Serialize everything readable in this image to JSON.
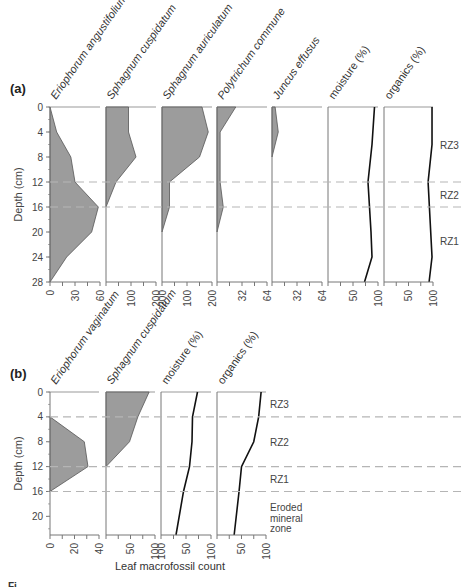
{
  "chart_data": [
    {
      "type": "area",
      "panel_label": "(a)",
      "ylabel": "Depth (cm)",
      "ylim": [
        0,
        28
      ],
      "yticks": [
        0,
        4,
        8,
        12,
        16,
        20,
        24,
        28
      ],
      "zone_boundaries": [
        12,
        16
      ],
      "zones": [
        {
          "label": "RZ3",
          "depth": 6
        },
        {
          "label": "RZ2",
          "depth": 14
        },
        {
          "label": "RZ1",
          "depth": 21.5
        }
      ],
      "series": [
        {
          "name": "Eriophorum angustifolium",
          "kind": "fill",
          "xlim": [
            0,
            60
          ],
          "xticks": [
            "0",
            "30",
            "60"
          ],
          "depth": [
            0,
            4,
            8,
            12,
            16,
            20,
            24,
            28
          ],
          "values": [
            0,
            8,
            25,
            30,
            58,
            50,
            20,
            0
          ]
        },
        {
          "name": "Sphagnum cuspidatum",
          "kind": "fill",
          "xlim": [
            0,
            200
          ],
          "xticks": [
            "100",
            "200"
          ],
          "depth": [
            0,
            4,
            8,
            12,
            16
          ],
          "values": [
            90,
            90,
            120,
            40,
            0
          ]
        },
        {
          "name": "Sphagnum auriculatum",
          "kind": "fill",
          "xlim": [
            0,
            200
          ],
          "xticks": [
            "200",
            "100",
            "200"
          ],
          "depth": [
            0,
            4,
            8,
            12,
            16,
            20
          ],
          "values": [
            160,
            185,
            150,
            30,
            30,
            0
          ]
        },
        {
          "name": "Polytrichum commune",
          "kind": "fill",
          "xlim": [
            0,
            64
          ],
          "xticks": [
            "32",
            "64"
          ],
          "depth": [
            0,
            4,
            12,
            16,
            20
          ],
          "values": [
            24,
            4,
            4,
            8,
            0
          ]
        },
        {
          "name": "Juncus effusus",
          "kind": "fill",
          "xlim": [
            0,
            64
          ],
          "xticks": [
            "32",
            "64"
          ],
          "depth": [
            0,
            4,
            8
          ],
          "values": [
            4,
            8,
            0
          ]
        },
        {
          "name": "moisture (%)",
          "kind": "line",
          "xlim": [
            0,
            100
          ],
          "xticks": [
            "50",
            "100"
          ],
          "depth": [
            0,
            6,
            12,
            20,
            24,
            28
          ],
          "values": [
            93,
            88,
            80,
            86,
            88,
            73
          ]
        },
        {
          "name": "organics (%)",
          "kind": "line",
          "xlim": [
            0,
            100
          ],
          "xticks": [
            "50",
            "100"
          ],
          "depth": [
            0,
            6,
            12,
            18,
            24,
            28
          ],
          "values": [
            98,
            98,
            90,
            94,
            98,
            92
          ]
        }
      ]
    },
    {
      "type": "area",
      "panel_label": "(b)",
      "ylabel": "Depth (cm)",
      "ylim": [
        0,
        23
      ],
      "yticks": [
        0,
        4,
        8,
        12,
        16,
        20
      ],
      "zone_boundaries": [
        4,
        12,
        16
      ],
      "zones": [
        {
          "label": "RZ3",
          "depth": 2
        },
        {
          "label": "RZ2",
          "depth": 8
        },
        {
          "label": "RZ1",
          "depth": 14
        },
        {
          "label": "Eroded",
          "depth": 18.5
        },
        {
          "label": "mineral",
          "depth": 20.2
        },
        {
          "label": "zone",
          "depth": 21.9
        }
      ],
      "series": [
        {
          "name": "Eriophorum vaginatum",
          "kind": "fill",
          "xlim": [
            0,
            40
          ],
          "xticks": [
            "0",
            "20",
            "40"
          ],
          "depth": [
            4,
            8,
            12,
            16
          ],
          "values": [
            0,
            28,
            31,
            0
          ]
        },
        {
          "name": "Sphagnum cuspidatum",
          "kind": "fill",
          "xlim": [
            0,
            100
          ],
          "xticks": [
            "50",
            "100"
          ],
          "depth": [
            0,
            4,
            8,
            12
          ],
          "values": [
            88,
            65,
            48,
            0
          ]
        },
        {
          "name": "moisture (%)",
          "kind": "line",
          "xlim": [
            0,
            100
          ],
          "xticks": [
            "100",
            "50",
            "100"
          ],
          "depth": [
            0,
            4,
            8,
            12,
            16,
            23
          ],
          "values": [
            73,
            63,
            62,
            57,
            45,
            30
          ]
        },
        {
          "name": "organics (%)",
          "kind": "line",
          "xlim": [
            0,
            100
          ],
          "xticks": [
            "50",
            "100"
          ],
          "depth": [
            0,
            4,
            8,
            12,
            16,
            23
          ],
          "values": [
            90,
            85,
            75,
            50,
            45,
            35
          ]
        }
      ]
    }
  ],
  "xlabel": "Leaf macrofossil count",
  "caption_fragment": "Fi"
}
